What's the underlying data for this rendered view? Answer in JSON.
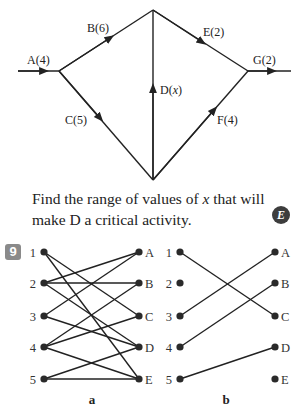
{
  "network": {
    "activities": [
      {
        "id": "A",
        "label": "A(4)",
        "duration": 4,
        "from": "start",
        "to": "n1"
      },
      {
        "id": "B",
        "label": "B(6)",
        "duration": 6,
        "from": "n1",
        "to": "n2"
      },
      {
        "id": "C",
        "label": "C(5)",
        "duration": 5,
        "from": "n1",
        "to": "n3"
      },
      {
        "id": "D",
        "label": "D(x)",
        "duration": "x",
        "from": "n3",
        "to": "n2"
      },
      {
        "id": "E",
        "label": "E(2)",
        "duration": 2,
        "from": "n2",
        "to": "n4"
      },
      {
        "id": "F",
        "label": "F(4)",
        "duration": 4,
        "from": "n3",
        "to": "n4"
      },
      {
        "id": "G",
        "label": "G(2)",
        "duration": 2,
        "from": "n4",
        "to": "end"
      }
    ]
  },
  "question": {
    "line1_pre": "Find the range of values of ",
    "variable": "x",
    "line1_post": " that will",
    "line2": "make D a critical activity.",
    "badge": "E"
  },
  "exercise": {
    "number": "9",
    "graphs": [
      {
        "label": "a",
        "left_nodes": [
          "1",
          "2",
          "3",
          "4",
          "5"
        ],
        "right_nodes": [
          "A",
          "B",
          "C",
          "D",
          "E"
        ],
        "edges": [
          [
            "1",
            "C"
          ],
          [
            "1",
            "E"
          ],
          [
            "2",
            "A"
          ],
          [
            "2",
            "B"
          ],
          [
            "2",
            "D"
          ],
          [
            "3",
            "A"
          ],
          [
            "3",
            "D"
          ],
          [
            "4",
            "B"
          ],
          [
            "4",
            "C"
          ],
          [
            "4",
            "E"
          ],
          [
            "5",
            "D"
          ],
          [
            "5",
            "E"
          ]
        ]
      },
      {
        "label": "b",
        "left_nodes": [
          "1",
          "2",
          "3",
          "4",
          "5"
        ],
        "right_nodes": [
          "A",
          "B",
          "C",
          "D",
          "E"
        ],
        "edges": [
          [
            "1",
            "C"
          ],
          [
            "3",
            "A"
          ],
          [
            "4",
            "B"
          ],
          [
            "5",
            "D"
          ]
        ]
      }
    ]
  }
}
